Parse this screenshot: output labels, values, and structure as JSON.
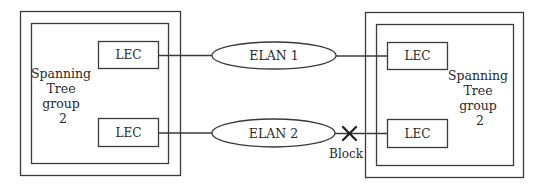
{
  "colors": {
    "stroke": "#3a3a3a",
    "text": "#2a2a2a",
    "background": "#ffffff"
  },
  "left_group": {
    "label_lines": [
      "Spanning",
      "Tree",
      "group",
      "2"
    ],
    "lec_top": "LEC",
    "lec_bottom": "LEC"
  },
  "right_group": {
    "label_lines": [
      "Spanning",
      "Tree",
      "group",
      "2"
    ],
    "lec_top": "LEC",
    "lec_bottom": "LEC"
  },
  "elans": [
    {
      "label": "ELAN 1"
    },
    {
      "label": "ELAN 2"
    }
  ],
  "block_marker": {
    "icon": "x-cross",
    "label": "Block"
  }
}
